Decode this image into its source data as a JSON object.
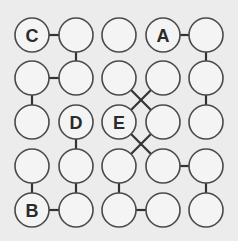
{
  "diagram": {
    "type": "node-grid-puzzle",
    "rows": 5,
    "cols": 5,
    "col_x": [
      32,
      76,
      119,
      163,
      206
    ],
    "row_y": [
      35,
      78,
      122,
      166,
      210
    ],
    "radius": 17,
    "colors": {
      "background": "#ececec",
      "node_fill": "#f4f4f4",
      "node_stroke": "#4a4a4a",
      "edge": "#333333",
      "label": "#2a2a2a"
    },
    "labels": [
      {
        "row": 0,
        "col": 0,
        "text": "C"
      },
      {
        "row": 0,
        "col": 3,
        "text": "A"
      },
      {
        "row": 2,
        "col": 1,
        "text": "D"
      },
      {
        "row": 2,
        "col": 2,
        "text": "E"
      },
      {
        "row": 4,
        "col": 0,
        "text": "B"
      }
    ],
    "edges": [
      [
        [
          0,
          0
        ],
        [
          0,
          1
        ]
      ],
      [
        [
          0,
          1
        ],
        [
          1,
          1
        ]
      ],
      [
        [
          1,
          0
        ],
        [
          1,
          1
        ]
      ],
      [
        [
          1,
          0
        ],
        [
          2,
          0
        ]
      ],
      [
        [
          0,
          3
        ],
        [
          0,
          4
        ]
      ],
      [
        [
          0,
          4
        ],
        [
          1,
          4
        ]
      ],
      [
        [
          1,
          4
        ],
        [
          2,
          4
        ]
      ],
      [
        [
          1,
          2
        ],
        [
          2,
          3
        ]
      ],
      [
        [
          1,
          3
        ],
        [
          2,
          2
        ]
      ],
      [
        [
          2,
          2
        ],
        [
          3,
          3
        ]
      ],
      [
        [
          2,
          3
        ],
        [
          3,
          2
        ]
      ],
      [
        [
          2,
          1
        ],
        [
          3,
          1
        ]
      ],
      [
        [
          3,
          1
        ],
        [
          4,
          1
        ]
      ],
      [
        [
          3,
          0
        ],
        [
          4,
          0
        ]
      ],
      [
        [
          4,
          0
        ],
        [
          4,
          1
        ]
      ],
      [
        [
          3,
          2
        ],
        [
          4,
          2
        ]
      ],
      [
        [
          4,
          2
        ],
        [
          4,
          3
        ]
      ],
      [
        [
          3,
          3
        ],
        [
          3,
          4
        ]
      ],
      [
        [
          3,
          4
        ],
        [
          4,
          4
        ]
      ]
    ]
  }
}
